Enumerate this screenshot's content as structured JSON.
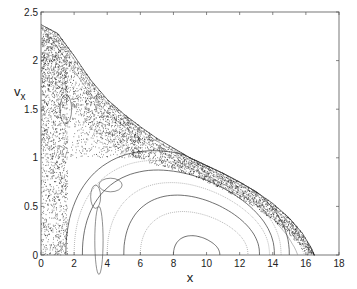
{
  "chart_data": {
    "type": "scatter",
    "title": "",
    "xlabel": "x",
    "ylabel": "v_x",
    "ylabel_main": "v",
    "ylabel_sub": "x",
    "xlim": [
      0,
      18
    ],
    "ylim": [
      0,
      2.5
    ],
    "grid": false,
    "legend": null,
    "xticks": [
      0,
      2,
      4,
      6,
      8,
      10,
      12,
      14,
      16,
      18
    ],
    "yticks": [
      0,
      0.5,
      1,
      1.5,
      2,
      2.5
    ],
    "xtick_labels": [
      "0",
      "2",
      "4",
      "6",
      "8",
      "10",
      "12",
      "14",
      "16",
      "18"
    ],
    "ytick_labels": [
      "0",
      "0.5",
      "1",
      "1.5",
      "2",
      "2.5"
    ],
    "boundary_curve": {
      "x": [
        0,
        1,
        2,
        3,
        4,
        5,
        6,
        7,
        8,
        9,
        10,
        11,
        12,
        13,
        14,
        15,
        15.8,
        16.3,
        16.5
      ],
      "y": [
        2.37,
        2.28,
        2.05,
        1.8,
        1.6,
        1.45,
        1.32,
        1.2,
        1.1,
        1.0,
        0.92,
        0.84,
        0.75,
        0.65,
        0.53,
        0.38,
        0.22,
        0.08,
        0
      ]
    },
    "invariant_curves": [
      {
        "name": "curve-1",
        "x_left": 8.0,
        "x_right": 10.8,
        "y_peak": 0.2
      },
      {
        "name": "curve-2",
        "x_left": 6.0,
        "x_right": 12.5,
        "y_peak": 0.45
      },
      {
        "name": "curve-3",
        "x_left": 5.0,
        "x_right": 13.2,
        "y_peak": 0.62
      },
      {
        "name": "curve-4",
        "x_left": 4.0,
        "x_right": 13.8,
        "y_peak": 0.75
      },
      {
        "name": "curve-5",
        "x_left": 2.5,
        "x_right": 14.1,
        "y_peak": 0.88
      },
      {
        "name": "curve-6",
        "x_left": 2.0,
        "x_right": 14.5,
        "y_peak": 0.98
      },
      {
        "name": "curve-7",
        "x_left": 1.5,
        "x_right": 15.0,
        "y_peak": 1.08
      }
    ],
    "chaotic_regions": [
      {
        "name": "left-sea",
        "x_range": [
          0,
          1.5
        ],
        "y_range": [
          0,
          2.3
        ]
      },
      {
        "name": "outer-band",
        "x_range": [
          1,
          16.5
        ],
        "y_range": [
          0,
          2.3
        ]
      }
    ]
  }
}
